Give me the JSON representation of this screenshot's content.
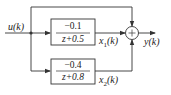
{
  "diagram": {
    "type": "block-diagram",
    "input_label": "u(k)",
    "output_label": "y(k)",
    "blocks": [
      {
        "id": "upper",
        "numerator": "−0.1",
        "denominator": "z+0.5",
        "output_signal": "x",
        "output_sub": "1",
        "output_arg": "(k)"
      },
      {
        "id": "lower",
        "numerator": "−0.4",
        "denominator": "z+0.8",
        "output_signal": "x",
        "output_sub": "2",
        "output_arg": "(k)"
      }
    ],
    "summing_junction": {
      "symbol": "+"
    },
    "colors": {
      "line": "#333333",
      "background": "#ffffff"
    }
  }
}
